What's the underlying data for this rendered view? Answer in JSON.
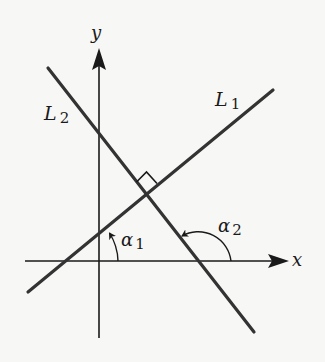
{
  "diagram": {
    "axes": {
      "x_label": "x",
      "y_label": "y"
    },
    "lines": [
      {
        "name": "L",
        "subscript": "1",
        "description": "line with positive slope"
      },
      {
        "name": "L",
        "subscript": "2",
        "description": "line with negative slope, perpendicular to L1"
      }
    ],
    "angles": [
      {
        "symbol": "α",
        "subscript": "1",
        "description": "inclination angle of L1 measured from x-axis"
      },
      {
        "symbol": "α",
        "subscript": "2",
        "description": "inclination angle of L2 measured from x-axis"
      }
    ],
    "right_angle_marker": true,
    "colors": {
      "background": "#f7f7f5",
      "stroke": "#1a1a1a",
      "lines": "#333333"
    }
  }
}
